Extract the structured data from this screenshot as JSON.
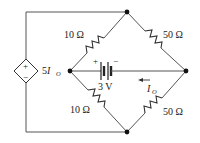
{
  "diagram": {
    "type": "circuit",
    "nodes": [
      {
        "id": "top",
        "x": 127,
        "y": 12
      },
      {
        "id": "left",
        "x": 70,
        "y": 71
      },
      {
        "id": "right",
        "x": 186,
        "y": 71
      },
      {
        "id": "bottom",
        "x": 127,
        "y": 132
      }
    ],
    "components": {
      "r_top_left": {
        "label": "10 Ω",
        "value": "10",
        "unit": "Ω"
      },
      "r_top_right": {
        "label": "50 Ω",
        "value": "50",
        "unit": "Ω"
      },
      "r_bottom_left": {
        "label": "10 Ω",
        "value": "10",
        "unit": "Ω"
      },
      "r_bottom_right": {
        "label": "50 Ω",
        "value": "50",
        "unit": "Ω"
      },
      "battery": {
        "label": "3 V",
        "plus": "+",
        "minus": "−"
      },
      "dependent_source": {
        "label_coef": "5",
        "label_var": "I",
        "label_sub": "O",
        "plus": "+",
        "minus": "−"
      },
      "current": {
        "label_var": "I",
        "label_sub": "O",
        "direction": "left"
      }
    },
    "colors": {
      "wire": "#555555",
      "node": "#111111",
      "text": "#222222",
      "background": "#ffffff"
    }
  }
}
